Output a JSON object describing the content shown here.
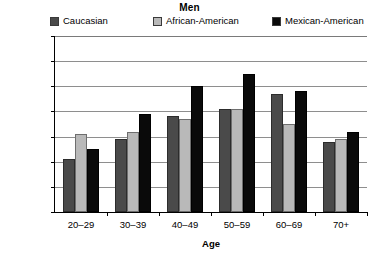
{
  "chart_data": {
    "type": "bar",
    "title": "Men",
    "xlabel": "Age",
    "ylabel_line1": "Percent with body-mass",
    "ylabel_line2": "index > 27.8 kg/m",
    "ylabel_exponent": "2",
    "categories": [
      "20–29",
      "30–39",
      "40–49",
      "50–59",
      "60–69",
      "70+"
    ],
    "series": [
      {
        "name": "Caucasian",
        "color": "#4a4a4a",
        "values": [
          21,
          29,
          38,
          41,
          47,
          28
        ]
      },
      {
        "name": "African-American",
        "color": "#b9b9b9",
        "values": [
          31,
          32,
          37,
          41,
          35,
          29
        ]
      },
      {
        "name": "Mexican-American",
        "color": "#0a0a0a",
        "values": [
          25,
          39,
          50,
          55,
          48,
          32
        ]
      }
    ],
    "ylim": [
      0,
      70
    ],
    "yticks": [
      70,
      60,
      50,
      40,
      30,
      20,
      10,
      0
    ],
    "grid": true,
    "legend_position": "top"
  }
}
